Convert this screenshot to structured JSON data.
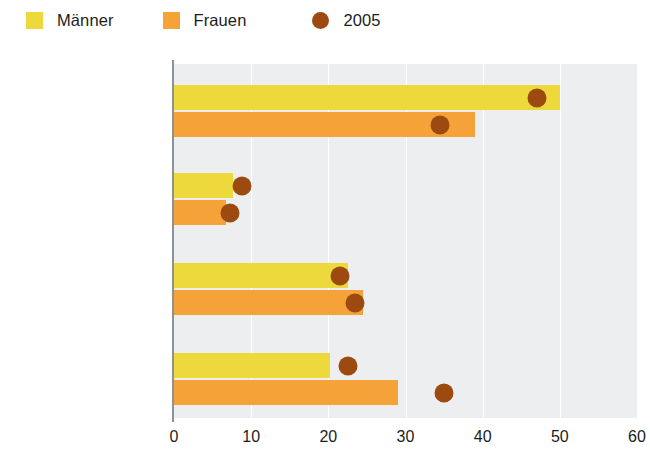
{
  "legend": {
    "items": [
      {
        "label": "Männer",
        "color": "#edd93b",
        "shape": "square",
        "icon": "legend-square-icon"
      },
      {
        "label": "Frauen",
        "color": "#f5a338",
        "shape": "square",
        "icon": "legend-square-icon"
      },
      {
        "label": "2005",
        "color": "#9d4a11",
        "shape": "circle",
        "icon": "legend-circle-icon"
      }
    ]
  },
  "chart_data": {
    "type": "bar",
    "orientation": "horizontal",
    "title": "",
    "subtitle": "",
    "xlabel": "",
    "ylabel": "",
    "xlim": [
      0,
      60
    ],
    "xticks": [
      0,
      10,
      20,
      30,
      40,
      50,
      60
    ],
    "xtick_labels": [
      "0",
      "10",
      "20",
      "30",
      "40",
      "50",
      "60"
    ],
    "grid": true,
    "grid_axis": "x",
    "legend_position": "top-left",
    "categories": [
      "Erwerbstätigkeit",
      "Arbeitslosengeld/ Sozialleistungen",
      "Rente und Vermögen",
      "Angehörige"
    ],
    "category_lines": [
      [
        "Erwerbstätigkeit"
      ],
      [
        "Arbeitslosengeld/",
        "Sozialleistungen"
      ],
      [
        "Rente und Vermögen"
      ],
      [
        "Angehörige"
      ]
    ],
    "series": [
      {
        "name": "Männer",
        "color": "#edd93b",
        "values": [
          50,
          7.7,
          22.5,
          20.2
        ]
      },
      {
        "name": "Frauen",
        "color": "#f5a338",
        "values": [
          39,
          6.7,
          24.5,
          29
        ]
      }
    ],
    "markers": [
      {
        "name": "2005",
        "color": "#9d4a11",
        "series": "Männer",
        "values": [
          47,
          8.8,
          21.5,
          22.5
        ]
      },
      {
        "name": "2005",
        "color": "#9d4a11",
        "series": "Frauen",
        "values": [
          34.5,
          7.2,
          23.5,
          35
        ]
      }
    ],
    "plot_background": "#eceeef"
  }
}
